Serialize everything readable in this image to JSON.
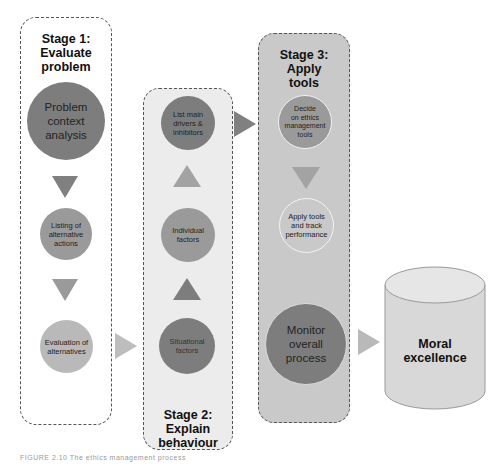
{
  "stages": [
    {
      "title": "Stage 1:\nEvaluate\nproblem",
      "l1": "Stage 1:",
      "l2": "Evaluate",
      "l3": "problem",
      "nodes": [
        {
          "label_lines": [
            "Problem",
            "context",
            "analysis"
          ]
        },
        {
          "label_lines": [
            "Listing of",
            "alternative",
            "actions"
          ]
        },
        {
          "label_lines": [
            "Evaluation of",
            "alternatives"
          ]
        }
      ]
    },
    {
      "l1": "Stage 2:",
      "l2": "Explain",
      "l3": "behaviour",
      "nodes": [
        {
          "label_lines": [
            "List main",
            "drivers &",
            "inhibitors"
          ]
        },
        {
          "label_lines": [
            "Individual",
            "factors"
          ]
        },
        {
          "label_lines": [
            "Situational",
            "factors"
          ]
        }
      ]
    },
    {
      "l1": "Stage 3:",
      "l2": "Apply",
      "l3": "tools",
      "nodes": [
        {
          "label_lines": [
            "Decide",
            "on ethics",
            "management",
            "tools"
          ]
        },
        {
          "label_lines": [
            "Apply tools",
            "and track",
            "performance"
          ]
        },
        {
          "label_lines": [
            "Monitor",
            "overall",
            "process"
          ]
        }
      ]
    }
  ],
  "outcome": {
    "l1": "Moral",
    "l2": "excellence"
  },
  "caption": "FIGURE 2.10  The ethics management process",
  "colors": {
    "dark": "#7d7d7d",
    "mid": "#9a9a9a",
    "light": "#b9b9b9",
    "stage2_bg": "#ececec",
    "stage3_bg": "#c9c9c9"
  }
}
